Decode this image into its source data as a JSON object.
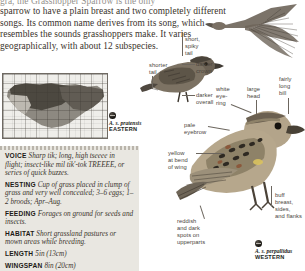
{
  "intro": {
    "clipped_line": "gra, the Grasshopper Sparrow is the only",
    "lines": [
      "sparrow to have a plain breast and two completely different",
      "songs. Its common name derives from its song, which",
      "resembles the sounds grasshoppers make. It varies",
      "geographically, with about 12 subspecies."
    ]
  },
  "map": {
    "name": "range-map",
    "caption": ""
  },
  "facts": [
    {
      "label": "VOICE",
      "text": "Sharp tik; long, high tseeee in flight; insect-like mil tik'-tok TREEEE, or series of quick buzzes."
    },
    {
      "label": "NESTING",
      "text": "Cup of grass placed in clump of grass and very well concealed; 3–6 eggs; 1–2 broods; Apr–Aug."
    },
    {
      "label": "FEEDING",
      "text": "Forages on ground for seeds and insects."
    },
    {
      "label": "HABITAT",
      "text": "Short grassland pastures or mown areas while breeding."
    },
    {
      "label": "LENGTH",
      "text": "5in (13cm)"
    },
    {
      "label": "WINGSPAN",
      "text": "8in (20cm)"
    }
  ],
  "labels": {
    "shorter_tail": "shorter\ntail",
    "short_spiky_tail": "short,\nspiky\ntail",
    "darker_crown": "darker\ncrown",
    "darker_overall": "darker\noverall",
    "white_eye_ring": "white\neye-\nring",
    "large_head": "large\nhead",
    "fairly_long_bill": "fairly\nlong\nbill",
    "pale_eyebrow": "pale\neyebrow",
    "yellow_bend_wing": "yellow\nat bend\nof wing",
    "reddish_dark_spots": "reddish\nand dark\nspots on\nupperparts",
    "buff_breast": "buff\nbreast,\nsides,\nand flanks"
  },
  "subspecies": [
    {
      "sci": "A. s. pratensis",
      "region": "EASTERN"
    },
    {
      "sci": "A. s. perpallidus",
      "region": "WESTERN"
    }
  ],
  "colors": {
    "page_bg": "#ffffff",
    "fact_panel": "#e9e7e1",
    "text": "#2a2622",
    "leader": "#6c665e",
    "bird_body": "#8a7f6d"
  }
}
